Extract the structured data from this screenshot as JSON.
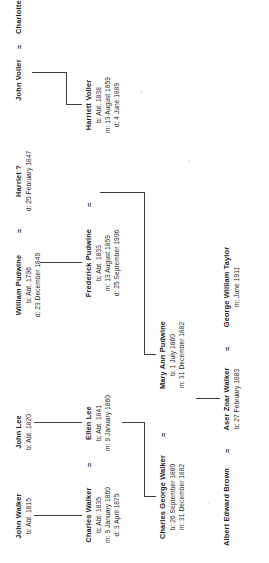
{
  "document": {
    "kind": "family-tree-chart",
    "orientation": "rotated-90-ccw",
    "ink_color": "#1b1b1b",
    "line_color": "#3d3d3d",
    "background_color": "#ffffff"
  },
  "symbols": {
    "marriage": "=",
    "birth_prefix": "b:",
    "marriage_prefix": "m:",
    "death_prefix": "d:"
  },
  "people": {
    "john_walker": {
      "name": "John Walker",
      "birth": "b: Abt. 1815"
    },
    "john_lee": {
      "name": "John Lee",
      "birth": "b: Abt. 1820"
    },
    "william_pudwine": {
      "name": "William Pudwine",
      "birth": "b: Abt. 1796",
      "death": "d: 23 December 1849"
    },
    "harriet_q": {
      "name": "Harriet ?",
      "death": "d: 20 February 1847"
    },
    "john_voller": {
      "name": "John Voller"
    },
    "charlotte": {
      "name": "Charlotte"
    },
    "charles_walker": {
      "name": "Charles Walker",
      "birth": "b: Abt. 1835",
      "marriage": "m: 9 January 1860",
      "death": "d: 3 April 1875"
    },
    "ellen_lee": {
      "name": "Ellen Lee",
      "birth": "b: Abt. 1841",
      "marriage": "m: 9 January 1860"
    },
    "frederick_pudwine": {
      "name": "Frederick Pudwine",
      "birth": "b: Abt. 1833",
      "marriage": "m: 13 August 1859",
      "death": "d: 25 September 1906"
    },
    "harriett_voller": {
      "name": "Harriett Voller",
      "birth": "b: Abt. 1838",
      "marriage": "m: 13 August 1859",
      "death": "d: 4 June 1889"
    },
    "charles_george_walker": {
      "name": "Charles George Walker",
      "birth": "b: 26 September 1860",
      "marriage": "m: 31 December 1882"
    },
    "mary_ann_pudwine": {
      "name": "Mary Ann Pudwine",
      "birth": "b: 1 July 1860",
      "marriage": "m: 31 December 1882"
    },
    "albert_edward_brown": {
      "name": "Albert Edward Brown"
    },
    "aser_zoar_walker": {
      "name": "Aser Zoar Walker",
      "birth": "b: 27 February 1883"
    },
    "george_william_taylor": {
      "name": "George William Taylor",
      "marriage": "m: June 1911"
    }
  }
}
